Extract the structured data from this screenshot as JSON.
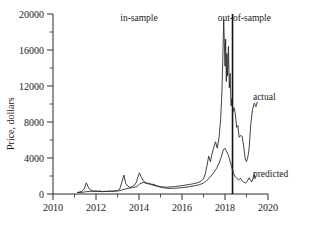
{
  "chart_data": {
    "type": "line",
    "title": "",
    "xlabel": "",
    "ylabel": "Price, dollars",
    "xlim": [
      2010,
      2020
    ],
    "ylim": [
      0,
      20000
    ],
    "grid": false,
    "legend_position": "inline-right",
    "x_ticks": [
      2010,
      2012,
      2014,
      2016,
      2018,
      2020
    ],
    "x_tick_labels": [
      "2010",
      "2012",
      "2014",
      "2016",
      "2018",
      "2020"
    ],
    "x_minor_ticks": [
      2011,
      2013,
      2015,
      2017,
      2019
    ],
    "y_ticks": [
      0,
      4000,
      8000,
      12000,
      16000,
      20000
    ],
    "y_tick_labels": [
      "0",
      "4000",
      "8000",
      "12000",
      "16000",
      "20000"
    ],
    "y_minor_ticks": [
      2000,
      6000,
      10000,
      14000,
      18000
    ],
    "annotations": [
      {
        "name": "in-sample",
        "text": "in-sample",
        "x": 2014.0,
        "y": 19200
      },
      {
        "name": "out-of-sample",
        "text": "out-of-sample",
        "x": 2018.9,
        "y": 19200
      },
      {
        "name": "sample-divider",
        "text": "",
        "x": 2018.35,
        "y_from": 0,
        "y_to": 20000
      }
    ],
    "series": [
      {
        "name": "actual",
        "label": "actual",
        "color": "#222222",
        "label_x": 2019.3,
        "label_y": 10400,
        "points": [
          [
            2011.15,
            180
          ],
          [
            2011.25,
            230
          ],
          [
            2011.35,
            320
          ],
          [
            2011.45,
            560
          ],
          [
            2011.55,
            1250
          ],
          [
            2011.62,
            860
          ],
          [
            2011.7,
            520
          ],
          [
            2011.8,
            380
          ],
          [
            2011.9,
            300
          ],
          [
            2012.0,
            340
          ],
          [
            2012.1,
            280
          ],
          [
            2012.2,
            330
          ],
          [
            2012.3,
            250
          ],
          [
            2012.4,
            290
          ],
          [
            2012.5,
            270
          ],
          [
            2012.62,
            330
          ],
          [
            2012.72,
            290
          ],
          [
            2012.85,
            310
          ],
          [
            2013.0,
            380
          ],
          [
            2013.1,
            520
          ],
          [
            2013.22,
            1450
          ],
          [
            2013.3,
            2100
          ],
          [
            2013.38,
            1180
          ],
          [
            2013.48,
            880
          ],
          [
            2013.58,
            720
          ],
          [
            2013.7,
            850
          ],
          [
            2013.8,
            1020
          ],
          [
            2013.88,
            1320
          ],
          [
            2013.95,
            1880
          ],
          [
            2014.02,
            2350
          ],
          [
            2014.1,
            1900
          ],
          [
            2014.2,
            1450
          ],
          [
            2014.32,
            1250
          ],
          [
            2014.45,
            1180
          ],
          [
            2014.58,
            1100
          ],
          [
            2014.7,
            1050
          ],
          [
            2014.85,
            900
          ],
          [
            2015.0,
            820
          ],
          [
            2015.15,
            780
          ],
          [
            2015.3,
            760
          ],
          [
            2015.5,
            800
          ],
          [
            2015.7,
            830
          ],
          [
            2015.88,
            900
          ],
          [
            2016.05,
            950
          ],
          [
            2016.22,
            1020
          ],
          [
            2016.4,
            1080
          ],
          [
            2016.55,
            1150
          ],
          [
            2016.72,
            1250
          ],
          [
            2016.88,
            1400
          ],
          [
            2017.0,
            1700
          ],
          [
            2017.08,
            2200
          ],
          [
            2017.16,
            3100
          ],
          [
            2017.24,
            4200
          ],
          [
            2017.32,
            3600
          ],
          [
            2017.4,
            4500
          ],
          [
            2017.48,
            5200
          ],
          [
            2017.56,
            5800
          ],
          [
            2017.64,
            5100
          ],
          [
            2017.72,
            6200
          ],
          [
            2017.8,
            8400
          ],
          [
            2017.86,
            11500
          ],
          [
            2017.9,
            15200
          ],
          [
            2017.94,
            19400
          ],
          [
            2017.97,
            16800
          ],
          [
            2018.0,
            14200
          ],
          [
            2018.03,
            17200
          ],
          [
            2018.06,
            12500
          ],
          [
            2018.09,
            15600
          ],
          [
            2018.12,
            13100
          ],
          [
            2018.16,
            16400
          ],
          [
            2018.2,
            11800
          ],
          [
            2018.24,
            13400
          ],
          [
            2018.28,
            9800
          ],
          [
            2018.32,
            10600
          ],
          [
            2018.36,
            9100
          ],
          [
            2018.42,
            9600
          ],
          [
            2018.48,
            8900
          ],
          [
            2018.54,
            7400
          ],
          [
            2018.6,
            7600
          ],
          [
            2018.66,
            6300
          ],
          [
            2018.72,
            6500
          ],
          [
            2018.8,
            6400
          ],
          [
            2018.88,
            5100
          ],
          [
            2018.94,
            3900
          ],
          [
            2019.0,
            3600
          ],
          [
            2019.06,
            4100
          ],
          [
            2019.12,
            5000
          ],
          [
            2019.2,
            7800
          ],
          [
            2019.28,
            9400
          ],
          [
            2019.36,
            10100
          ],
          [
            2019.44,
            9700
          ],
          [
            2019.5,
            10200
          ]
        ]
      },
      {
        "name": "predicted",
        "label": "predicted",
        "color": "#222222",
        "label_x": 2019.3,
        "label_y": 1850,
        "points": [
          [
            2011.15,
            150
          ],
          [
            2011.35,
            190
          ],
          [
            2011.55,
            260
          ],
          [
            2011.75,
            300
          ],
          [
            2012.0,
            310
          ],
          [
            2012.3,
            280
          ],
          [
            2012.6,
            300
          ],
          [
            2012.9,
            330
          ],
          [
            2013.1,
            360
          ],
          [
            2013.3,
            520
          ],
          [
            2013.5,
            640
          ],
          [
            2013.7,
            700
          ],
          [
            2013.9,
            820
          ],
          [
            2014.05,
            1150
          ],
          [
            2014.2,
            1280
          ],
          [
            2014.4,
            1150
          ],
          [
            2014.6,
            1020
          ],
          [
            2014.85,
            860
          ],
          [
            2015.05,
            720
          ],
          [
            2015.3,
            640
          ],
          [
            2015.55,
            620
          ],
          [
            2015.8,
            660
          ],
          [
            2016.05,
            720
          ],
          [
            2016.3,
            800
          ],
          [
            2016.55,
            900
          ],
          [
            2016.8,
            1020
          ],
          [
            2017.0,
            1220
          ],
          [
            2017.15,
            1500
          ],
          [
            2017.3,
            1850
          ],
          [
            2017.45,
            2300
          ],
          [
            2017.6,
            2800
          ],
          [
            2017.72,
            3400
          ],
          [
            2017.84,
            4200
          ],
          [
            2017.92,
            4900
          ],
          [
            2018.0,
            5100
          ],
          [
            2018.08,
            4700
          ],
          [
            2018.16,
            4300
          ],
          [
            2018.24,
            3600
          ],
          [
            2018.32,
            2900
          ],
          [
            2018.4,
            2300
          ],
          [
            2018.48,
            1900
          ],
          [
            2018.56,
            1700
          ],
          [
            2018.64,
            1550
          ],
          [
            2018.72,
            1750
          ],
          [
            2018.8,
            1450
          ],
          [
            2018.88,
            1300
          ],
          [
            2018.96,
            1200
          ],
          [
            2019.04,
            1450
          ],
          [
            2019.12,
            1800
          ],
          [
            2019.18,
            1550
          ],
          [
            2019.24,
            1350
          ],
          [
            2019.3,
            1700
          ],
          [
            2019.36,
            2250
          ],
          [
            2019.42,
            1750
          ]
        ]
      }
    ]
  }
}
